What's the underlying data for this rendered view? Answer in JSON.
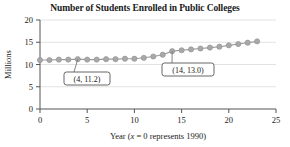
{
  "chart_data": {
    "type": "scatter",
    "title": "Number of Students Enrolled in Public Colleges",
    "xlabel_prefix": "Year (",
    "xlabel_italic": "x",
    "xlabel_suffix": " = 0 represents 1990)",
    "ylabel": "Millions",
    "xlim": [
      0,
      25
    ],
    "ylim": [
      0,
      20
    ],
    "xticks": [
      "0",
      "5",
      "10",
      "15",
      "20",
      "25"
    ],
    "xtick_values": [
      0,
      5,
      10,
      15,
      20,
      25
    ],
    "yticks": [
      "0",
      "5",
      "10",
      "15",
      "20"
    ],
    "ytick_values": [
      0,
      5,
      10,
      15,
      20
    ],
    "grid": "horizontal",
    "legend": "none",
    "marker_color": "#a8a8a8",
    "trend_color": "#9a9a9a",
    "x": [
      0,
      1,
      2,
      3,
      4,
      5,
      6,
      7,
      8,
      9,
      10,
      11,
      12,
      13,
      14,
      15,
      16,
      17,
      18,
      19,
      20,
      21,
      22,
      23
    ],
    "values": [
      11.0,
      11.0,
      11.1,
      11.1,
      11.2,
      11.1,
      11.1,
      11.2,
      11.2,
      11.3,
      11.3,
      11.5,
      11.8,
      12.2,
      13.0,
      13.2,
      13.4,
      13.6,
      13.8,
      14.0,
      14.3,
      14.6,
      14.9,
      15.2
    ],
    "annotations": [
      {
        "label": "(4, 11.2)",
        "x": 4,
        "y": 11.2
      },
      {
        "label": "(14, 13.0)",
        "x": 14,
        "y": 13.0
      }
    ]
  }
}
